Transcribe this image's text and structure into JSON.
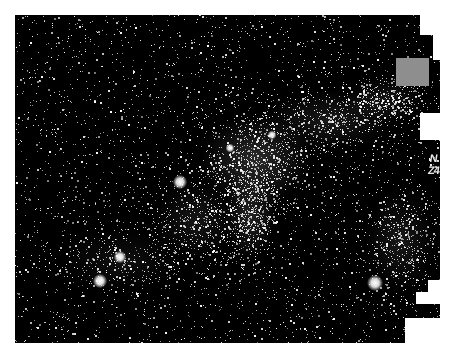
{
  "image": {
    "description": "Astronomical star field photograph with a dense Milky Way-like band of stars running diagonally from lower-left to upper-right",
    "background_color": "#000000",
    "page_color": "#ffffff",
    "star_color": "#ffffff",
    "frame": {
      "left": 15,
      "top": 15,
      "right": 440,
      "bottom": 343
    },
    "cluster_regions": [
      {
        "cx": 255,
        "cy": 160,
        "rx": 55,
        "ry": 45,
        "density": 1.0
      },
      {
        "cx": 250,
        "cy": 215,
        "rx": 25,
        "ry": 45,
        "density": 0.8
      },
      {
        "cx": 330,
        "cy": 120,
        "rx": 70,
        "ry": 30,
        "density": 0.55
      },
      {
        "cx": 385,
        "cy": 100,
        "rx": 40,
        "ry": 22,
        "density": 0.5
      },
      {
        "cx": 195,
        "cy": 220,
        "rx": 40,
        "ry": 40,
        "density": 0.5
      },
      {
        "cx": 400,
        "cy": 240,
        "rx": 35,
        "ry": 50,
        "density": 0.55
      },
      {
        "cx": 120,
        "cy": 260,
        "rx": 60,
        "ry": 30,
        "density": 0.35
      }
    ],
    "bright_stars": [
      {
        "x": 180,
        "y": 182,
        "r": 4
      },
      {
        "x": 120,
        "y": 257,
        "r": 3.5
      },
      {
        "x": 100,
        "y": 281,
        "r": 4
      },
      {
        "x": 375,
        "y": 283,
        "r": 4.5
      },
      {
        "x": 230,
        "y": 148,
        "r": 2.5
      },
      {
        "x": 272,
        "y": 135,
        "r": 2.5
      }
    ],
    "background_star_count": 3200,
    "cluster_star_count": 2600
  },
  "overlays": {
    "gray_box": {
      "x": 396,
      "y": 58,
      "w": 33,
      "h": 28,
      "color": "#8e8e8e"
    },
    "white_cutouts": [
      {
        "x": 420,
        "y": 15,
        "w": 30,
        "h": 20
      },
      {
        "x": 433,
        "y": 35,
        "w": 17,
        "h": 25
      },
      {
        "x": 420,
        "y": 113,
        "w": 30,
        "h": 27
      },
      {
        "x": 440,
        "y": 60,
        "w": 10,
        "h": 230
      },
      {
        "x": 428,
        "y": 280,
        "w": 22,
        "h": 12
      },
      {
        "x": 416,
        "y": 292,
        "w": 34,
        "h": 12
      },
      {
        "x": 405,
        "y": 318,
        "w": 45,
        "h": 32
      }
    ],
    "edge_label": "N\nZ4"
  },
  "top_caption": ""
}
